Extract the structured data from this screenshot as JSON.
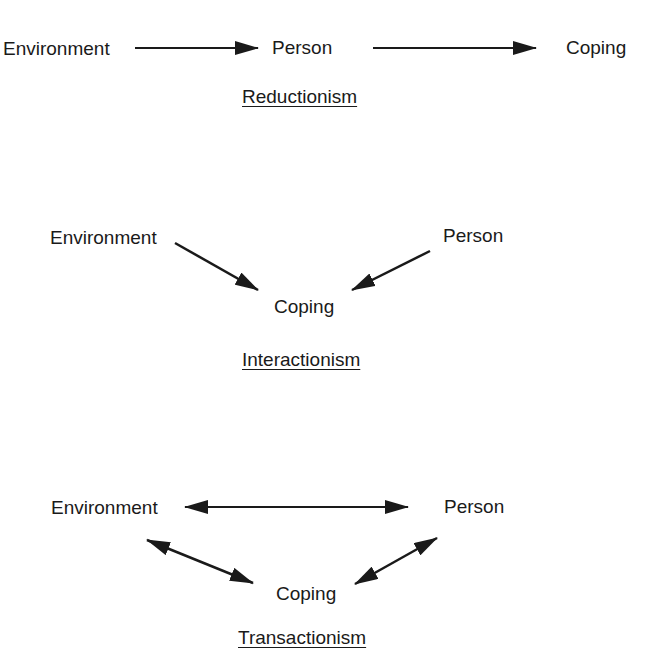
{
  "diagrams": [
    {
      "title": "Reductionism",
      "nodes": {
        "environment": "Environment",
        "person": "Person",
        "coping": "Coping"
      },
      "edges": [
        {
          "from": "Environment",
          "to": "Person",
          "direction": "forward"
        },
        {
          "from": "Person",
          "to": "Coping",
          "direction": "forward"
        }
      ]
    },
    {
      "title": "Interactionism",
      "nodes": {
        "environment": "Environment",
        "person": "Person",
        "coping": "Coping"
      },
      "edges": [
        {
          "from": "Environment",
          "to": "Coping",
          "direction": "forward"
        },
        {
          "from": "Person",
          "to": "Coping",
          "direction": "forward"
        }
      ]
    },
    {
      "title": "Transactionism",
      "nodes": {
        "environment": "Environment",
        "person": "Person",
        "coping": "Coping"
      },
      "edges": [
        {
          "from": "Environment",
          "to": "Person",
          "direction": "bidirectional"
        },
        {
          "from": "Environment",
          "to": "Coping",
          "direction": "bidirectional"
        },
        {
          "from": "Person",
          "to": "Coping",
          "direction": "bidirectional"
        }
      ]
    }
  ]
}
